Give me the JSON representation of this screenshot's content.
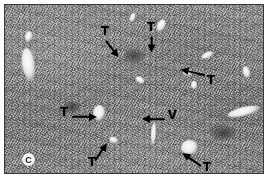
{
  "figure": {
    "kind": "histology-micrograph",
    "panel_label": "C",
    "background_color": "#ffffff",
    "plate_color": "#909090",
    "annotation_color": "#000000"
  },
  "annotations": [
    {
      "id": "t1",
      "label": "T",
      "icon": "arrow-icon",
      "direction": "down-right",
      "label_x": 96,
      "label_y": 19,
      "arrow_x": 101,
      "arrow_y": 31,
      "arrow_len": 20,
      "arrow_angle": 52
    },
    {
      "id": "t2",
      "label": "T",
      "icon": "arrow-icon",
      "direction": "down",
      "label_x": 142,
      "label_y": 15,
      "arrow_x": 147,
      "arrow_y": 27,
      "arrow_len": 15,
      "arrow_angle": 90
    },
    {
      "id": "t3",
      "label": "T",
      "icon": "arrow-icon",
      "direction": "left",
      "label_x": 202,
      "label_y": 68,
      "arrow_x": 200,
      "arrow_y": 66,
      "arrow_len": 24,
      "arrow_angle": 193
    },
    {
      "id": "t4",
      "label": "T",
      "icon": "arrow-icon",
      "direction": "right",
      "label_x": 55,
      "label_y": 100,
      "arrow_x": 67,
      "arrow_y": 107,
      "arrow_len": 24,
      "arrow_angle": 0
    },
    {
      "id": "v1",
      "label": "V",
      "icon": "arrow-icon",
      "direction": "left",
      "label_x": 163,
      "label_y": 103,
      "arrow_x": 160,
      "arrow_y": 110,
      "arrow_len": 22,
      "arrow_angle": 180
    },
    {
      "id": "t5",
      "label": "T",
      "icon": "arrow-icon",
      "direction": "up-right",
      "label_x": 83,
      "label_y": 150,
      "arrow_x": 90,
      "arrow_y": 151,
      "arrow_len": 20,
      "arrow_angle": -57
    },
    {
      "id": "t6",
      "label": "T",
      "icon": "arrow-icon",
      "direction": "up-left",
      "label_x": 198,
      "label_y": 155,
      "arrow_x": 196,
      "arrow_y": 157,
      "arrow_len": 22,
      "arrow_angle": 215
    }
  ],
  "vessels": [
    {
      "id": "v-left-large",
      "x": 17,
      "y": 43,
      "w": 13,
      "h": 33,
      "rot": -8,
      "tone": "bright"
    },
    {
      "id": "v-left-small",
      "x": 20,
      "y": 26,
      "w": 7,
      "h": 11,
      "rot": 12,
      "tone": "bright"
    },
    {
      "id": "v-top-mid",
      "x": 125,
      "y": 8,
      "w": 5,
      "h": 9,
      "rot": 20,
      "tone": "bright"
    },
    {
      "id": "v-top-right",
      "x": 152,
      "y": 14,
      "w": 8,
      "h": 13,
      "rot": 25,
      "tone": "bright"
    },
    {
      "id": "v-right-upper",
      "x": 196,
      "y": 47,
      "w": 13,
      "h": 6,
      "rot": -25,
      "tone": "bright"
    },
    {
      "id": "v-right-mid",
      "x": 178,
      "y": 64,
      "w": 9,
      "h": 7,
      "rot": 10,
      "tone": "bright"
    },
    {
      "id": "v-right-low",
      "x": 186,
      "y": 76,
      "w": 6,
      "h": 8,
      "rot": 0,
      "tone": "bright"
    },
    {
      "id": "v-portal-mid",
      "x": 88,
      "y": 100,
      "w": 12,
      "h": 16,
      "rot": 6,
      "tone": "bright"
    },
    {
      "id": "v-central",
      "x": 176,
      "y": 135,
      "w": 17,
      "h": 15,
      "rot": -12,
      "tone": "bright"
    },
    {
      "id": "v-right-long",
      "x": 222,
      "y": 102,
      "w": 34,
      "h": 9,
      "rot": -14,
      "tone": "bright"
    },
    {
      "id": "v-bottom-left",
      "x": 104,
      "y": 132,
      "w": 9,
      "h": 6,
      "rot": 18,
      "tone": "bright"
    },
    {
      "id": "v-far-right",
      "x": 238,
      "y": 61,
      "w": 7,
      "h": 12,
      "rot": -15,
      "tone": "bright"
    },
    {
      "id": "v-mid-faint",
      "x": 130,
      "y": 72,
      "w": 10,
      "h": 6,
      "rot": 30,
      "tone": "bright"
    },
    {
      "id": "v-lower-mid",
      "x": 146,
      "y": 118,
      "w": 5,
      "h": 22,
      "rot": 4,
      "tone": "bright"
    },
    {
      "id": "v-dark-left",
      "x": 58,
      "y": 96,
      "w": 18,
      "h": 12,
      "rot": 0,
      "tone": "dark"
    },
    {
      "id": "v-dark-mid",
      "x": 118,
      "y": 44,
      "w": 22,
      "h": 14,
      "rot": 0,
      "tone": "dark"
    },
    {
      "id": "v-dark-right",
      "x": 205,
      "y": 120,
      "w": 26,
      "h": 16,
      "rot": 0,
      "tone": "dark"
    }
  ]
}
